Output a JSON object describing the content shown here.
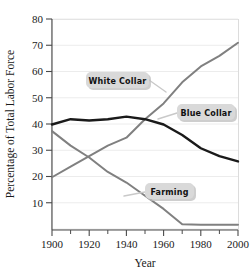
{
  "chart_data": {
    "type": "line",
    "title": "",
    "xlabel": "Year",
    "ylabel": "Percentage of Total Labor Force",
    "xlim": [
      1900,
      2000
    ],
    "ylim": [
      0,
      80
    ],
    "grid": true,
    "legend_position": "inline-callouts",
    "x_ticks": [
      1900,
      1920,
      1940,
      1960,
      1980,
      2000
    ],
    "x_tick_labels": [
      "1900",
      "1920",
      "1940",
      "1960",
      "1980",
      "2000"
    ],
    "x_minor_ticks": [
      1910,
      1930,
      1950,
      1970,
      1990
    ],
    "y_ticks": [
      10,
      20,
      30,
      40,
      50,
      60,
      70,
      80
    ],
    "y_tick_labels": [
      "10",
      "20",
      "30",
      "40",
      "50",
      "60",
      "70",
      "80"
    ],
    "x": [
      1900,
      1910,
      1920,
      1930,
      1940,
      1950,
      1960,
      1970,
      1980,
      1990,
      2000
    ],
    "series": [
      {
        "name": "White Collar",
        "color": "#808080",
        "width": 2.0,
        "values": [
          20,
          24,
          28,
          32,
          35,
          42,
          48,
          56,
          62,
          66,
          71
        ]
      },
      {
        "name": "Blue Collar",
        "color": "#1a1a1a",
        "width": 2.4,
        "values": [
          40,
          42,
          41.5,
          42,
          43,
          42,
          40,
          36,
          31,
          28,
          26
        ]
      },
      {
        "name": "Farming",
        "color": "#808080",
        "width": 2.0,
        "values": [
          37.5,
          32,
          27.5,
          22,
          18,
          13,
          8,
          2.2,
          2,
          2,
          2
        ]
      }
    ],
    "annotations": [
      {
        "name": "white-collar",
        "label": "White Collar",
        "pill_x": 86,
        "pill_y": 72,
        "pill_w": 63,
        "pill_h": 16,
        "leader": "M 149 80 L 166 92"
      },
      {
        "name": "blue-collar",
        "label": "Blue Collar",
        "pill_x": 177,
        "pill_y": 104,
        "pill_w": 58,
        "pill_h": 16,
        "leader": "M 177 113 L 158 119"
      },
      {
        "name": "farming",
        "label": "Farming",
        "pill_x": 145,
        "pill_y": 183,
        "pill_w": 49,
        "pill_h": 16,
        "leader": "M 145 192 L 124 196"
      }
    ]
  }
}
